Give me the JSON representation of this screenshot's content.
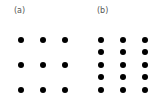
{
  "panels": [
    {
      "label": "(a)",
      "label_pos": [
        14,
        7
      ],
      "columns_x": [
        21,
        43,
        65
      ],
      "rows_y": [
        40,
        65,
        90
      ]
    },
    {
      "label": "(b)",
      "label_pos": [
        97,
        7
      ],
      "columns_x": [
        101,
        123,
        145
      ],
      "rows_y": [
        40,
        52,
        65,
        77,
        90
      ]
    }
  ],
  "colors": {
    "dot": "#000000",
    "label": "#555555"
  }
}
